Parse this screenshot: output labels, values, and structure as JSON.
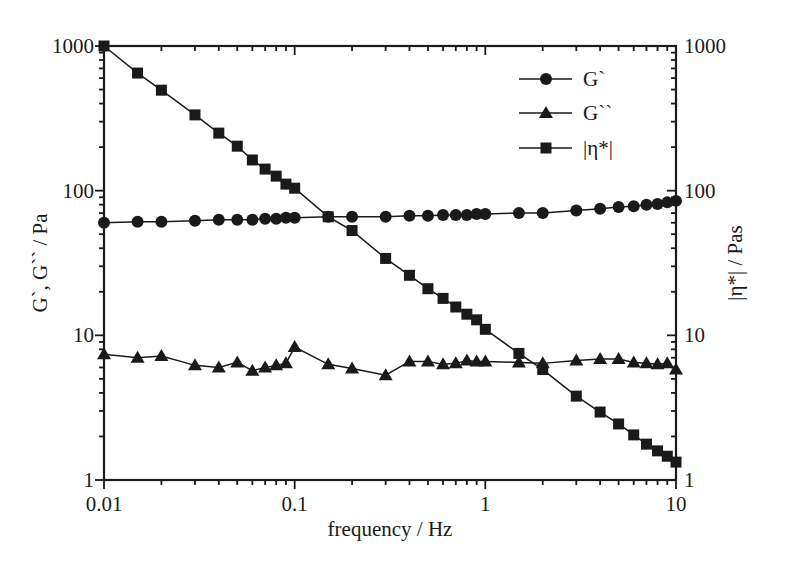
{
  "chart_data": {
    "type": "line",
    "title": "",
    "xlabel": "frequency / Hz",
    "ylabel": "G`, G`` / Pa",
    "y2label": "|η*| / Pas",
    "xscale": "log",
    "yscale": "log",
    "xlim": [
      0.01,
      10
    ],
    "ylim": [
      1,
      1000
    ],
    "y2lim": [
      1,
      1000
    ],
    "grid": false,
    "legend_position": "upper right",
    "x_ticks": [
      "0.01",
      "0.1",
      "1",
      "10"
    ],
    "y_ticks": [
      "1",
      "10",
      "100",
      "1000"
    ],
    "y2_ticks": [
      "1",
      "10",
      "100",
      "1000"
    ],
    "x": [
      0.01,
      0.015,
      0.02,
      0.03,
      0.04,
      0.05,
      0.06,
      0.07,
      0.08,
      0.09,
      0.1,
      0.15,
      0.2,
      0.3,
      0.4,
      0.5,
      0.6,
      0.7,
      0.8,
      0.9,
      1,
      1.5,
      2,
      3,
      4,
      5,
      6,
      7,
      8,
      9,
      10
    ],
    "series": [
      {
        "name": "G`",
        "marker": "circle",
        "axis": "left",
        "values": [
          60,
          61,
          61,
          62,
          63,
          63,
          63,
          64,
          64,
          65,
          65,
          66,
          66,
          66,
          67,
          67,
          68,
          68,
          68,
          69,
          69,
          70,
          70,
          73,
          75,
          77,
          78,
          80,
          81,
          83,
          85
        ]
      },
      {
        "name": "G``",
        "marker": "triangle",
        "axis": "left",
        "values": [
          7.4,
          7.0,
          7.2,
          6.2,
          6.0,
          6.5,
          5.7,
          6.0,
          6.2,
          6.4,
          8.3,
          6.3,
          5.9,
          5.3,
          6.6,
          6.6,
          6.3,
          6.4,
          6.7,
          6.6,
          6.6,
          6.5,
          6.4,
          6.7,
          6.85,
          6.85,
          6.5,
          6.4,
          6.3,
          6.4,
          5.8
        ]
      },
      {
        "name": "|η*|",
        "marker": "square",
        "axis": "right",
        "values": [
          1000,
          650,
          495,
          334,
          250,
          203,
          163,
          141,
          126,
          111,
          104,
          66,
          53,
          34,
          26,
          21,
          18,
          15.7,
          14,
          12.8,
          11,
          7.5,
          5.8,
          3.8,
          2.95,
          2.44,
          2.05,
          1.77,
          1.59,
          1.46,
          1.33
        ]
      }
    ]
  },
  "legend": {
    "items": [
      {
        "label": "G`",
        "marker": "circle"
      },
      {
        "label": "G``",
        "marker": "triangle"
      },
      {
        "label": "|η*|",
        "marker": "square"
      }
    ]
  },
  "colors": {
    "ink": "#1a1a1a",
    "background": "#ffffff"
  }
}
